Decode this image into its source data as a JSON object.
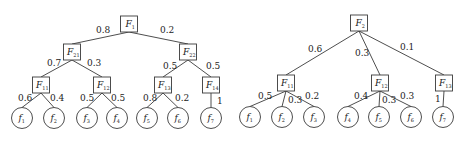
{
  "trees": [
    {
      "name": "left-tree",
      "root": "F1",
      "nodes": [
        {
          "id": "F1",
          "type": "box",
          "letter": "F",
          "sub": "1",
          "x": 129,
          "y": 24
        },
        {
          "id": "F21",
          "type": "box",
          "letter": "F",
          "sub": "21",
          "x": 72,
          "y": 52
        },
        {
          "id": "F22",
          "type": "box",
          "letter": "F",
          "sub": "22",
          "x": 188,
          "y": 52
        },
        {
          "id": "F11",
          "type": "box",
          "letter": "F",
          "sub": "11",
          "x": 41,
          "y": 85
        },
        {
          "id": "F12",
          "type": "box",
          "letter": "F",
          "sub": "12",
          "x": 102,
          "y": 85
        },
        {
          "id": "F13",
          "type": "box",
          "letter": "F",
          "sub": "13",
          "x": 163,
          "y": 85
        },
        {
          "id": "F14",
          "type": "box",
          "letter": "F",
          "sub": "14",
          "x": 211,
          "y": 85
        },
        {
          "id": "f1",
          "type": "circle",
          "letter": "f",
          "sub": "1",
          "x": 22,
          "y": 118
        },
        {
          "id": "f2",
          "type": "circle",
          "letter": "f",
          "sub": "2",
          "x": 54,
          "y": 118
        },
        {
          "id": "f3",
          "type": "circle",
          "letter": "f",
          "sub": "3",
          "x": 87,
          "y": 118
        },
        {
          "id": "f4",
          "type": "circle",
          "letter": "f",
          "sub": "4",
          "x": 117,
          "y": 118
        },
        {
          "id": "f5",
          "type": "circle",
          "letter": "f",
          "sub": "5",
          "x": 147,
          "y": 118
        },
        {
          "id": "f6",
          "type": "circle",
          "letter": "f",
          "sub": "6",
          "x": 178,
          "y": 118
        },
        {
          "id": "f7",
          "type": "circle",
          "letter": "f",
          "sub": "7",
          "x": 211,
          "y": 118
        }
      ],
      "edges": [
        {
          "from": "F1",
          "to": "F21",
          "weight": "0.8",
          "lx": 96,
          "ly": 33
        },
        {
          "from": "F1",
          "to": "F22",
          "weight": "0.2",
          "lx": 160,
          "ly": 33
        },
        {
          "from": "F21",
          "to": "F11",
          "weight": "0.7",
          "lx": 47,
          "ly": 66
        },
        {
          "from": "F21",
          "to": "F12",
          "weight": "0.3",
          "lx": 87,
          "ly": 66
        },
        {
          "from": "F22",
          "to": "F13",
          "weight": "0.5",
          "lx": 163,
          "ly": 69
        },
        {
          "from": "F22",
          "to": "F14",
          "weight": "0.5",
          "lx": 206,
          "ly": 69
        },
        {
          "from": "F11",
          "to": "f1",
          "weight": "0.6",
          "lx": 18,
          "ly": 101
        },
        {
          "from": "F11",
          "to": "f2",
          "weight": "0.4",
          "lx": 50,
          "ly": 101
        },
        {
          "from": "F12",
          "to": "f3",
          "weight": "0.5",
          "lx": 80,
          "ly": 101
        },
        {
          "from": "F12",
          "to": "f4",
          "weight": "0.5",
          "lx": 111,
          "ly": 101
        },
        {
          "from": "F13",
          "to": "f5",
          "weight": "0.8",
          "lx": 143,
          "ly": 101
        },
        {
          "from": "F13",
          "to": "f6",
          "weight": "0.2",
          "lx": 175,
          "ly": 101
        },
        {
          "from": "F14",
          "to": "f7",
          "weight": "1",
          "lx": 217,
          "ly": 104
        }
      ]
    },
    {
      "name": "right-tree",
      "root": "F2",
      "nodes": [
        {
          "id": "F2",
          "type": "box",
          "letter": "F",
          "sub": "2",
          "x": 359,
          "y": 23
        },
        {
          "id": "F11",
          "type": "box",
          "letter": "F",
          "sub": "11",
          "x": 286,
          "y": 83
        },
        {
          "id": "F12",
          "type": "box",
          "letter": "F",
          "sub": "12",
          "x": 380,
          "y": 83
        },
        {
          "id": "F13",
          "type": "box",
          "letter": "F",
          "sub": "13",
          "x": 444,
          "y": 83
        },
        {
          "id": "f1",
          "type": "circle",
          "letter": "f",
          "sub": "1",
          "x": 250,
          "y": 117
        },
        {
          "id": "f2",
          "type": "circle",
          "letter": "f",
          "sub": "2",
          "x": 282,
          "y": 117
        },
        {
          "id": "f3",
          "type": "circle",
          "letter": "f",
          "sub": "3",
          "x": 314,
          "y": 117
        },
        {
          "id": "f4",
          "type": "circle",
          "letter": "f",
          "sub": "4",
          "x": 348,
          "y": 117
        },
        {
          "id": "f5",
          "type": "circle",
          "letter": "f",
          "sub": "5",
          "x": 379,
          "y": 117
        },
        {
          "id": "f6",
          "type": "circle",
          "letter": "f",
          "sub": "6",
          "x": 411,
          "y": 117
        },
        {
          "id": "f7",
          "type": "circle",
          "letter": "f",
          "sub": "7",
          "x": 443,
          "y": 117
        }
      ],
      "edges": [
        {
          "from": "F2",
          "to": "F11",
          "weight": "0.6",
          "lx": 308,
          "ly": 52
        },
        {
          "from": "F2",
          "to": "F12",
          "weight": "0.3",
          "lx": 355,
          "ly": 56
        },
        {
          "from": "F2",
          "to": "F13",
          "weight": "0.1",
          "lx": 400,
          "ly": 50
        },
        {
          "from": "F11",
          "to": "f1",
          "weight": "0.5",
          "lx": 258,
          "ly": 99
        },
        {
          "from": "F11",
          "to": "f2",
          "weight": "0.3",
          "lx": 288,
          "ly": 103
        },
        {
          "from": "F11",
          "to": "f3",
          "weight": "0.2",
          "lx": 305,
          "ly": 99
        },
        {
          "from": "F12",
          "to": "f4",
          "weight": "0.4",
          "lx": 354,
          "ly": 99
        },
        {
          "from": "F12",
          "to": "f5",
          "weight": "0.3",
          "lx": 382,
          "ly": 103
        },
        {
          "from": "F12",
          "to": "f6",
          "weight": "0.3",
          "lx": 400,
          "ly": 99
        },
        {
          "from": "F13",
          "to": "f7",
          "weight": "1",
          "lx": 435,
          "ly": 102
        }
      ]
    }
  ]
}
